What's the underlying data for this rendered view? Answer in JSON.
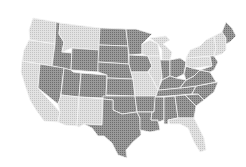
{
  "map": {
    "type": "choropleth",
    "region": "United States (contiguous)",
    "colors": {
      "dark": "#8a8a8a",
      "light": "#d6d6d6",
      "background": "#ffffff"
    },
    "states": [
      {
        "id": "WA",
        "shade": "light"
      },
      {
        "id": "OR",
        "shade": "light"
      },
      {
        "id": "CA",
        "shade": "light"
      },
      {
        "id": "ID",
        "shade": "dark"
      },
      {
        "id": "NV",
        "shade": "dark"
      },
      {
        "id": "MT",
        "shade": "light"
      },
      {
        "id": "WY",
        "shade": "dark"
      },
      {
        "id": "UT",
        "shade": "dark"
      },
      {
        "id": "AZ",
        "shade": "light"
      },
      {
        "id": "CO",
        "shade": "dark"
      },
      {
        "id": "NM",
        "shade": "light"
      },
      {
        "id": "ND",
        "shade": "dark"
      },
      {
        "id": "SD",
        "shade": "dark"
      },
      {
        "id": "NE",
        "shade": "dark"
      },
      {
        "id": "KS",
        "shade": "dark"
      },
      {
        "id": "OK",
        "shade": "dark"
      },
      {
        "id": "TX",
        "shade": "dark"
      },
      {
        "id": "MN",
        "shade": "dark"
      },
      {
        "id": "IA",
        "shade": "dark"
      },
      {
        "id": "MO",
        "shade": "light"
      },
      {
        "id": "AR",
        "shade": "dark"
      },
      {
        "id": "LA",
        "shade": "dark"
      },
      {
        "id": "WI",
        "shade": "light"
      },
      {
        "id": "IL",
        "shade": "light"
      },
      {
        "id": "MI",
        "shade": "light"
      },
      {
        "id": "IN",
        "shade": "dark"
      },
      {
        "id": "OH",
        "shade": "dark"
      },
      {
        "id": "KY",
        "shade": "dark"
      },
      {
        "id": "TN",
        "shade": "dark"
      },
      {
        "id": "MS",
        "shade": "dark"
      },
      {
        "id": "AL",
        "shade": "dark"
      },
      {
        "id": "GA",
        "shade": "dark"
      },
      {
        "id": "FL",
        "shade": "light"
      },
      {
        "id": "SC",
        "shade": "dark"
      },
      {
        "id": "NC",
        "shade": "dark"
      },
      {
        "id": "VA",
        "shade": "dark"
      },
      {
        "id": "WV",
        "shade": "dark"
      },
      {
        "id": "PA",
        "shade": "light"
      },
      {
        "id": "NY",
        "shade": "light"
      },
      {
        "id": "NE_states",
        "shade": "light"
      },
      {
        "id": "ME",
        "shade": "dark"
      }
    ]
  }
}
